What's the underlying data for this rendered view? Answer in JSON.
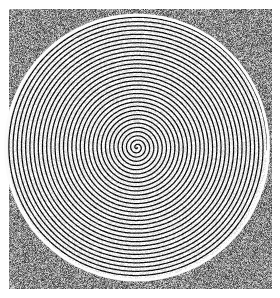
{
  "figure": {
    "title": "Archimedean spiral embedded in uniform random noise",
    "kind": "grayscale-raster-figure",
    "width": 280,
    "height": 298,
    "background_color": "#ffffff"
  },
  "panel": {
    "name": "noise-panel",
    "x": 9,
    "y": 9,
    "width": 263,
    "height": 280,
    "noise": {
      "type": "uniform-salt-and-pepper",
      "mean_gray": 150,
      "min_gray": 40,
      "max_gray": 235,
      "grain_px": 1
    }
  },
  "chart_data": {
    "type": "scatter",
    "title": "Archimedean spiral embedded in uniform random noise",
    "subtitle": "",
    "xlabel": "",
    "ylabel": "",
    "grid": false,
    "legend": null,
    "xlim": [
      9,
      272
    ],
    "ylim": [
      9,
      289
    ],
    "spiral": {
      "form": "archimedean",
      "equation": "r = b * theta",
      "center_x": 137,
      "center_y": 147.5,
      "turns": 31,
      "pitch_px": 4.2,
      "b_per_radian": 0.6685,
      "theta_start_rad": 0.0,
      "theta_end_rad": 194.8,
      "direction": "counterclockwise",
      "semi_axis_x": 130,
      "semi_axis_y": 131,
      "line_width_px": 1.25,
      "line_color": "#111111",
      "fill_color": "#f2f2f2"
    },
    "halo": {
      "name": "bright-edge-ring",
      "color": "#fbfbfb",
      "thickness_px": 5,
      "semi_axis_x": 133,
      "semi_axis_y": 134
    }
  },
  "colors": {
    "ink": "#111111",
    "paper": "#ffffff",
    "noise_mid": "#969696",
    "halo": "#fbfbfb"
  }
}
